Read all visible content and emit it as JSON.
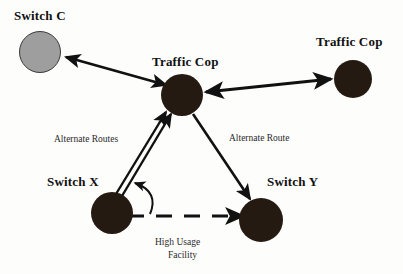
{
  "diagram": {
    "title_visible": false,
    "background_color": "#fdfdfc",
    "nodes": [
      {
        "id": "switch_c",
        "label": "Switch C",
        "shape": "circle",
        "fill": "#9e9e9e",
        "stroke": "#3a3a3a",
        "cx": 40,
        "cy": 52,
        "r": 21,
        "label_x": 14,
        "label_y": 8
      },
      {
        "id": "traffic_cop_center",
        "label": "Traffic Cop",
        "shape": "circle",
        "fill": "#241a12",
        "stroke": "#241a12",
        "cx": 182,
        "cy": 95,
        "r": 21,
        "label_x": 152,
        "label_y": 54
      },
      {
        "id": "traffic_cop_right",
        "label": "Traffic Cop",
        "shape": "circle",
        "fill": "#241a12",
        "stroke": "#241a12",
        "cx": 353,
        "cy": 79,
        "r": 19,
        "label_x": 316,
        "label_y": 34
      },
      {
        "id": "switch_x",
        "label": "Switch X",
        "shape": "circle",
        "fill": "#241a12",
        "stroke": "#241a12",
        "cx": 112,
        "cy": 213,
        "r": 21,
        "label_x": 47,
        "label_y": 174
      },
      {
        "id": "switch_y",
        "label": "Switch Y",
        "shape": "circle",
        "fill": "#241a12",
        "stroke": "#241a12",
        "cx": 261,
        "cy": 220,
        "r": 22,
        "label_x": 267,
        "label_y": 174
      }
    ],
    "edges": [
      {
        "id": "edge_cop_to_switch_c",
        "from": "traffic_cop_center",
        "to": "switch_c",
        "style": "solid",
        "arrow": "both",
        "label": ""
      },
      {
        "id": "edge_cop_to_traffic_cop_right",
        "from": "traffic_cop_center",
        "to": "traffic_cop_right",
        "style": "solid",
        "arrow": "both",
        "label": ""
      },
      {
        "id": "edge_switch_x_to_cop_a",
        "from": "switch_x",
        "to": "traffic_cop_center",
        "style": "solid",
        "arrow": "end",
        "label": "Alternate Routes"
      },
      {
        "id": "edge_switch_x_to_cop_b",
        "from": "switch_x",
        "to": "traffic_cop_center",
        "style": "solid",
        "arrow": "end",
        "label": ""
      },
      {
        "id": "edge_cop_to_switch_y",
        "from": "traffic_cop_center",
        "to": "switch_y",
        "style": "solid",
        "arrow": "end",
        "label": "Alternate Route"
      },
      {
        "id": "edge_switch_x_to_switch_y",
        "from": "switch_x",
        "to": "switch_y",
        "style": "dashed",
        "arrow": "end",
        "label": "High Usage Facility"
      },
      {
        "id": "edge_reroute_curve",
        "from": "high_usage_facility",
        "to": "alternate_routes",
        "style": "curved",
        "arrow": "end",
        "label": ""
      }
    ],
    "edge_labels": [
      {
        "id": "label_alternate_routes",
        "text": "Alternate Routes",
        "x": 54,
        "y": 133
      },
      {
        "id": "label_alternate_route",
        "text": "Alternate Route",
        "x": 229,
        "y": 132
      },
      {
        "id": "label_high_usage_line1",
        "text": "High Usage",
        "x": 155,
        "y": 236
      },
      {
        "id": "label_high_usage_line2",
        "text": "Facility",
        "x": 168,
        "y": 249
      }
    ]
  }
}
